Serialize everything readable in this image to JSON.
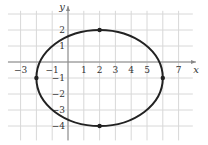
{
  "chart_data": {
    "type": "line",
    "title": "",
    "xlabel": "x",
    "ylabel": "y",
    "xlim": [
      -4,
      8
    ],
    "ylim": [
      -5,
      3
    ],
    "grid": true,
    "x_ticks": [
      "-3",
      "-1",
      "1",
      "2",
      "3",
      "4",
      "5",
      "7"
    ],
    "y_ticks": [
      "2",
      "1",
      "-1",
      "-2",
      "-3",
      "-4"
    ],
    "series": [
      {
        "name": "ellipse",
        "shape": "ellipse",
        "center": [
          2,
          -1
        ],
        "semi_major_x": 4,
        "semi_minor_y": 3,
        "equation": "(x-2)^2/16 + (y+1)^2/9 = 1"
      }
    ],
    "points": [
      {
        "x": -2,
        "y": -1
      },
      {
        "x": 6,
        "y": -1
      },
      {
        "x": 2,
        "y": 2
      },
      {
        "x": 2,
        "y": -4
      }
    ],
    "style": {
      "curve_color": "#222222",
      "grid_color": "#d8d8d8",
      "axis_color": "#888888"
    }
  }
}
